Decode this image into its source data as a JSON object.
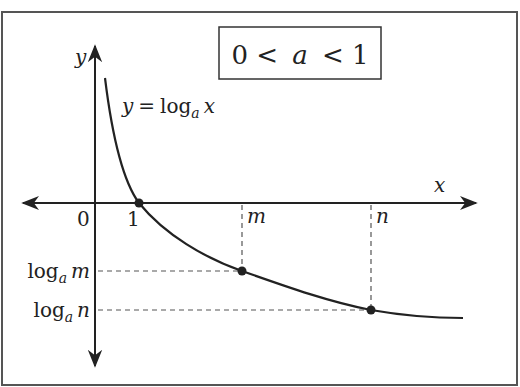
{
  "diagram": {
    "condition_label": "0 < a < 1",
    "condition_parts": [
      "0 <",
      "a",
      "< 1"
    ],
    "function_label": {
      "lhs": "y",
      "eq": "=",
      "log": "log",
      "base": "a",
      "arg": "x"
    },
    "axes": {
      "x_label": "x",
      "y_label": "y",
      "origin_label": "0"
    },
    "x_ticks": [
      {
        "label": "1",
        "italic": false
      },
      {
        "label": "m",
        "italic": true
      },
      {
        "label": "n",
        "italic": true
      }
    ],
    "y_ticks": [
      {
        "log": "log",
        "base": "a",
        "arg": "m"
      },
      {
        "log": "log",
        "base": "a",
        "arg": "n"
      }
    ],
    "points": [
      {
        "name": "one",
        "x_label": "1",
        "y_label": "0"
      },
      {
        "name": "m",
        "x_label": "m",
        "y_label": "log_a m"
      },
      {
        "name": "n",
        "x_label": "n",
        "y_label": "log_a n"
      }
    ],
    "colors": {
      "stroke": "#222222",
      "dashed": "#555555",
      "border": "#555555",
      "background": "#ffffff"
    }
  }
}
